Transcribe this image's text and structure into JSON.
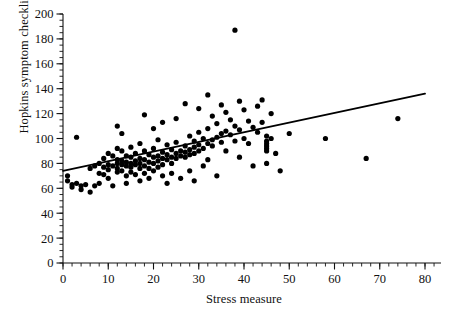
{
  "chart_data": {
    "type": "scatter",
    "title": "",
    "xlabel": "Stress measure",
    "ylabel": "Hopkins symptom checklist score",
    "xlim": [
      0,
      80
    ],
    "ylim": [
      0,
      200
    ],
    "xticks": [
      0,
      10,
      20,
      30,
      40,
      50,
      60,
      70,
      80
    ],
    "yticks": [
      0,
      20,
      40,
      60,
      80,
      100,
      120,
      140,
      160,
      180,
      200
    ],
    "x_minor_step": 2,
    "y_minor_step": 5,
    "grid": false,
    "legend": null,
    "marker": "filled-circle",
    "marker_color": "#000000",
    "points": [
      [
        1,
        70
      ],
      [
        1,
        66
      ],
      [
        2,
        63
      ],
      [
        2,
        61
      ],
      [
        3,
        101
      ],
      [
        3,
        64
      ],
      [
        4,
        62
      ],
      [
        4,
        59
      ],
      [
        5,
        63
      ],
      [
        6,
        57
      ],
      [
        6,
        76
      ],
      [
        7,
        78
      ],
      [
        7,
        62
      ],
      [
        8,
        80
      ],
      [
        8,
        72
      ],
      [
        8,
        64
      ],
      [
        9,
        84
      ],
      [
        9,
        77
      ],
      [
        9,
        71
      ],
      [
        10,
        88
      ],
      [
        10,
        79
      ],
      [
        10,
        75
      ],
      [
        10,
        68
      ],
      [
        11,
        62
      ],
      [
        11,
        86
      ],
      [
        11,
        78
      ],
      [
        12,
        110
      ],
      [
        12,
        92
      ],
      [
        12,
        83
      ],
      [
        12,
        80
      ],
      [
        12,
        76
      ],
      [
        12,
        73
      ],
      [
        13,
        104
      ],
      [
        13,
        90
      ],
      [
        13,
        82
      ],
      [
        13,
        79
      ],
      [
        13,
        74
      ],
      [
        14,
        86
      ],
      [
        14,
        81
      ],
      [
        14,
        78
      ],
      [
        14,
        70
      ],
      [
        14,
        64
      ],
      [
        15,
        93
      ],
      [
        15,
        85
      ],
      [
        15,
        80
      ],
      [
        15,
        77
      ],
      [
        15,
        73
      ],
      [
        16,
        88
      ],
      [
        16,
        82
      ],
      [
        16,
        79
      ],
      [
        16,
        71
      ],
      [
        17,
        96
      ],
      [
        17,
        84
      ],
      [
        17,
        80
      ],
      [
        17,
        76
      ],
      [
        17,
        66
      ],
      [
        18,
        119
      ],
      [
        18,
        90
      ],
      [
        18,
        83
      ],
      [
        18,
        78
      ],
      [
        18,
        72
      ],
      [
        19,
        87
      ],
      [
        19,
        81
      ],
      [
        19,
        76
      ],
      [
        19,
        68
      ],
      [
        20,
        108
      ],
      [
        20,
        92
      ],
      [
        20,
        85
      ],
      [
        20,
        80
      ],
      [
        20,
        74
      ],
      [
        21,
        99
      ],
      [
        21,
        86
      ],
      [
        21,
        82
      ],
      [
        21,
        77
      ],
      [
        22,
        113
      ],
      [
        22,
        89
      ],
      [
        22,
        84
      ],
      [
        22,
        79
      ],
      [
        22,
        70
      ],
      [
        23,
        95
      ],
      [
        23,
        87
      ],
      [
        23,
        83
      ],
      [
        23,
        64
      ],
      [
        24,
        91
      ],
      [
        24,
        85
      ],
      [
        24,
        80
      ],
      [
        24,
        72
      ],
      [
        25,
        116
      ],
      [
        25,
        97
      ],
      [
        25,
        88
      ],
      [
        25,
        84
      ],
      [
        26,
        90
      ],
      [
        26,
        86
      ],
      [
        26,
        68
      ],
      [
        27,
        128
      ],
      [
        27,
        94
      ],
      [
        27,
        89
      ],
      [
        27,
        85
      ],
      [
        28,
        102
      ],
      [
        28,
        91
      ],
      [
        28,
        87
      ],
      [
        28,
        74
      ],
      [
        29,
        98
      ],
      [
        29,
        93
      ],
      [
        29,
        88
      ],
      [
        29,
        66
      ],
      [
        30,
        124
      ],
      [
        30,
        105
      ],
      [
        30,
        95
      ],
      [
        30,
        90
      ],
      [
        31,
        100
      ],
      [
        31,
        92
      ],
      [
        31,
        78
      ],
      [
        32,
        135
      ],
      [
        32,
        108
      ],
      [
        32,
        96
      ],
      [
        32,
        83
      ],
      [
        33,
        118
      ],
      [
        33,
        99
      ],
      [
        33,
        94
      ],
      [
        34,
        112
      ],
      [
        34,
        101
      ],
      [
        34,
        70
      ],
      [
        35,
        127
      ],
      [
        35,
        104
      ],
      [
        35,
        97
      ],
      [
        36,
        121
      ],
      [
        36,
        106
      ],
      [
        36,
        90
      ],
      [
        37,
        115
      ],
      [
        37,
        103
      ],
      [
        38,
        187
      ],
      [
        38,
        110
      ],
      [
        38,
        98
      ],
      [
        39,
        130
      ],
      [
        39,
        107
      ],
      [
        39,
        85
      ],
      [
        40,
        123
      ],
      [
        40,
        100
      ],
      [
        41,
        114
      ],
      [
        41,
        96
      ],
      [
        42,
        109
      ],
      [
        42,
        78
      ],
      [
        43,
        126
      ],
      [
        43,
        105
      ],
      [
        44,
        131
      ],
      [
        44,
        113
      ],
      [
        45,
        102
      ],
      [
        45,
        98
      ],
      [
        45,
        96
      ],
      [
        45,
        94
      ],
      [
        45,
        92
      ],
      [
        45,
        90
      ],
      [
        45,
        80
      ],
      [
        46,
        120
      ],
      [
        46,
        100
      ],
      [
        47,
        88
      ],
      [
        48,
        74
      ],
      [
        50,
        104
      ],
      [
        58,
        100
      ],
      [
        67,
        84
      ],
      [
        74,
        116
      ]
    ],
    "regression_line": {
      "x_start": 0,
      "y_start": 74,
      "x_end": 80,
      "y_end": 136,
      "color": "#000000"
    }
  }
}
